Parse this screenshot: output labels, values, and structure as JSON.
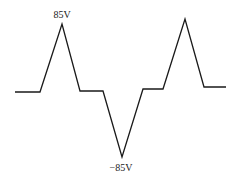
{
  "diagram": {
    "type": "waveform",
    "stroke_color": "#1a1a1a",
    "points": [
      [
        15,
        92
      ],
      [
        40,
        92
      ],
      [
        62,
        24
      ],
      [
        80,
        91
      ],
      [
        103,
        91
      ],
      [
        122,
        157
      ],
      [
        143,
        89
      ],
      [
        163,
        89
      ],
      [
        185,
        19
      ],
      [
        204,
        87
      ],
      [
        226,
        87
      ]
    ],
    "labels": [
      {
        "text": "85V",
        "x": 62,
        "y": 9
      },
      {
        "text": "−85V",
        "x": 121,
        "y": 162
      }
    ]
  }
}
